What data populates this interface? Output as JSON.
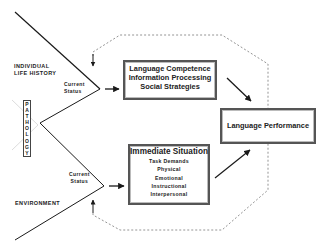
{
  "diagram": {
    "inputs": {
      "individual_life_history": "INDIVIDUAL\nLIFE HISTORY",
      "individual_line1": "INDIVIDUAL",
      "individual_line2": "LIFE HISTORY",
      "pathology": "PATHOLOGY",
      "pathology_letters": [
        "P",
        "A",
        "T",
        "H",
        "O",
        "L",
        "O",
        "G",
        "Y"
      ],
      "environment": "ENVIRONMENT"
    },
    "status_labels": {
      "upper_line1": "Current",
      "upper_line2": "Status",
      "lower_line1": "Current",
      "lower_line2": "Status"
    },
    "boxes": {
      "competence": {
        "lines": [
          "Language Competence",
          "Information Processing",
          "Social Strategies"
        ]
      },
      "situation": {
        "title": "Immediate Situation",
        "items": [
          "Task Demands",
          "Physical",
          "Emotional",
          "Instructional",
          "Interpersonal"
        ]
      },
      "performance": {
        "label": "Language Performance"
      }
    },
    "colors": {
      "line": "#1a1a1a",
      "dashed": "#888888",
      "box_border": "#555555"
    }
  }
}
